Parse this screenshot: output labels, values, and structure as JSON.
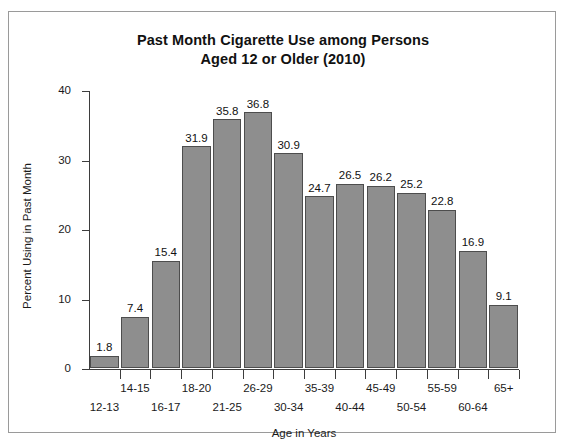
{
  "chart_data": {
    "type": "bar",
    "title": "Past Month Cigarette Use among Persons Aged 12 or Older (2010)",
    "title_line1": "Past Month Cigarette Use among Persons",
    "title_line2": "Aged 12 or Older (2010)",
    "xlabel": "Age in Years",
    "ylabel": "Percent Using in Past Month",
    "ylim": [
      0,
      40
    ],
    "yticks": [
      0,
      10,
      20,
      30,
      40
    ],
    "ytick_labels": [
      "0",
      "10",
      "20",
      "30",
      "40"
    ],
    "grid": false,
    "legend": "none",
    "bar_color": "#8e8e8e",
    "bar_edge_color": "#4d4d4d",
    "categories": [
      "12-13",
      "14-15",
      "16-17",
      "18-20",
      "21-25",
      "26-29",
      "30-34",
      "35-39",
      "40-44",
      "45-49",
      "50-54",
      "55-59",
      "60-64",
      "65+"
    ],
    "values": [
      1.8,
      7.4,
      15.4,
      31.9,
      35.8,
      36.8,
      30.9,
      24.7,
      26.5,
      26.2,
      25.2,
      22.8,
      16.9,
      9.1
    ],
    "value_labels": [
      "1.8",
      "7.4",
      "15.4",
      "31.9",
      "35.8",
      "36.8",
      "30.9",
      "24.7",
      "26.5",
      "26.2",
      "25.2",
      "22.8",
      "16.9",
      "9.1"
    ]
  },
  "footnote": ""
}
